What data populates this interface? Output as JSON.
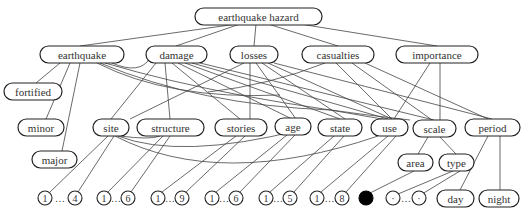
{
  "diagram": {
    "title": "earthquake hazard",
    "nodes": [
      {
        "id": "earthquake_hazard",
        "label": "earthquake hazard",
        "x": 195,
        "y": 8,
        "w": 127,
        "h": 17
      },
      {
        "id": "earthquake",
        "label": "earthquake",
        "x": 40,
        "y": 46,
        "w": 84,
        "h": 17
      },
      {
        "id": "damage",
        "label": "damage",
        "x": 146,
        "y": 46,
        "w": 61,
        "h": 17
      },
      {
        "id": "losses",
        "label": "losses",
        "x": 230,
        "y": 46,
        "w": 48,
        "h": 17
      },
      {
        "id": "casualties",
        "label": "casualties",
        "x": 302,
        "y": 46,
        "w": 72,
        "h": 17
      },
      {
        "id": "importance",
        "label": "importance",
        "x": 396,
        "y": 46,
        "w": 82,
        "h": 17
      },
      {
        "id": "fortified",
        "label": "fortified",
        "x": 4,
        "y": 83,
        "w": 58,
        "h": 17
      },
      {
        "id": "minor",
        "label": "minor",
        "x": 18,
        "y": 119,
        "w": 46,
        "h": 17
      },
      {
        "id": "site",
        "label": "site",
        "x": 93,
        "y": 119,
        "w": 36,
        "h": 17
      },
      {
        "id": "structure",
        "label": "structure",
        "x": 137,
        "y": 119,
        "w": 67,
        "h": 17
      },
      {
        "id": "stories",
        "label": "stories",
        "x": 215,
        "y": 119,
        "w": 52,
        "h": 17
      },
      {
        "id": "age",
        "label": "age",
        "x": 275,
        "y": 118,
        "w": 36,
        "h": 17
      },
      {
        "id": "state",
        "label": "state",
        "x": 318,
        "y": 119,
        "w": 44,
        "h": 17
      },
      {
        "id": "use",
        "label": "use",
        "x": 371,
        "y": 119,
        "w": 37,
        "h": 17
      },
      {
        "id": "scale",
        "label": "scale",
        "x": 413,
        "y": 120,
        "w": 43,
        "h": 17
      },
      {
        "id": "period",
        "label": "period",
        "x": 465,
        "y": 119,
        "w": 55,
        "h": 17
      },
      {
        "id": "major",
        "label": "major",
        "x": 32,
        "y": 151,
        "w": 45,
        "h": 17
      },
      {
        "id": "area",
        "label": "area",
        "x": 398,
        "y": 154,
        "w": 35,
        "h": 17
      },
      {
        "id": "type",
        "label": "type",
        "x": 439,
        "y": 154,
        "w": 35,
        "h": 17
      },
      {
        "id": "day",
        "label": "day",
        "x": 437,
        "y": 190,
        "w": 37,
        "h": 17
      },
      {
        "id": "night",
        "label": "night",
        "x": 479,
        "y": 190,
        "w": 40,
        "h": 17
      }
    ],
    "value_groups": [
      {
        "id": "site_vals",
        "first": "1",
        "last": "4",
        "cx1": 45,
        "cx2": 75,
        "cy": 198
      },
      {
        "id": "structure_vals",
        "first": "1",
        "last": "6",
        "cx1": 104,
        "cx2": 128,
        "cy": 198
      },
      {
        "id": "stories_vals",
        "first": "1",
        "last": "9",
        "cx1": 158,
        "cx2": 182,
        "cy": 198
      },
      {
        "id": "age_vals",
        "first": "1",
        "last": "6",
        "cx1": 212,
        "cx2": 236,
        "cy": 198
      },
      {
        "id": "state_vals",
        "first": "1",
        "last": "5",
        "cx1": 266,
        "cx2": 290,
        "cy": 198
      },
      {
        "id": "use_vals",
        "first": "1",
        "last": "8",
        "cx1": 317,
        "cx2": 342,
        "cy": 198
      },
      {
        "id": "type_vals",
        "first": "·",
        "last": "·",
        "cx1": 393,
        "cx2": 419,
        "cy": 198
      }
    ],
    "ellipsis": "…",
    "filled_circle": {
      "id": "area_val",
      "cx": 366,
      "cy": 198,
      "r": 7
    },
    "circle_radius": 7,
    "edges": [
      {
        "path": "M 237 24 L 80 46"
      },
      {
        "path": "M 240 24 L 176 46"
      },
      {
        "path": "M 256 24 L 254 46"
      },
      {
        "path": "M 268 24 L 338 46"
      },
      {
        "path": "M 300 24 L 437 46"
      },
      {
        "path": "M 60 63 L 36 83"
      },
      {
        "path": "M 70 63 L 46 119"
      },
      {
        "path": "M 80 63 L 62 151"
      },
      {
        "path": "M 97 63 Q 170 100 280 95 L 280 95"
      },
      {
        "path": "M 100 63 Q 200 105 330 110 L 388 120"
      },
      {
        "path": "M 105 63 Q 230 100 410 120"
      },
      {
        "path": "M 112 63 Q 140 75 150 58"
      },
      {
        "path": "M 156 63 L 111 119"
      },
      {
        "path": "M 165 63 L 170 119"
      },
      {
        "path": "M 172 63 L 240 119"
      },
      {
        "path": "M 178 63 L 292 119"
      },
      {
        "path": "M 185 63 L 340 119"
      },
      {
        "path": "M 192 63 L 388 119"
      },
      {
        "path": "M 200 63 L 434 120"
      },
      {
        "path": "M 244 63 L 130 119"
      },
      {
        "path": "M 250 63 L 250 119"
      },
      {
        "path": "M 256 63 L 296 119"
      },
      {
        "path": "M 262 63 L 345 119"
      },
      {
        "path": "M 268 63 L 392 119"
      },
      {
        "path": "M 274 63 L 492 119"
      },
      {
        "path": "M 325 63 Q 270 85 208 92"
      },
      {
        "path": "M 336 63 L 392 119"
      },
      {
        "path": "M 352 63 L 432 120"
      },
      {
        "path": "M 365 63 L 488 119"
      },
      {
        "path": "M 430 63 L 394 119"
      },
      {
        "path": "M 440 63 L 440 120"
      },
      {
        "path": "M 120 136 Q 150 140 160 136"
      },
      {
        "path": "M 118 136 Q 180 160 300 130"
      },
      {
        "path": "M 115 136 Q 220 190 378 136"
      },
      {
        "path": "M 108 136 L 50 192"
      },
      {
        "path": "M 114 136 L 78 192"
      },
      {
        "path": "M 163 136 L 108 192"
      },
      {
        "path": "M 170 136 L 131 192"
      },
      {
        "path": "M 236 136 L 162 192"
      },
      {
        "path": "M 245 136 L 186 192"
      },
      {
        "path": "M 287 135 L 216 192"
      },
      {
        "path": "M 295 135 L 240 192"
      },
      {
        "path": "M 334 136 L 270 192"
      },
      {
        "path": "M 344 136 L 294 192"
      },
      {
        "path": "M 388 136 L 321 192"
      },
      {
        "path": "M 396 136 L 346 192"
      },
      {
        "path": "M 428 137 L 418 154"
      },
      {
        "path": "M 440 137 L 456 154"
      },
      {
        "path": "M 414 171 L 370 193"
      },
      {
        "path": "M 453 171 L 398 194"
      },
      {
        "path": "M 460 171 L 422 194"
      },
      {
        "path": "M 488 136 L 460 190"
      },
      {
        "path": "M 500 136 L 500 190"
      }
    ]
  }
}
